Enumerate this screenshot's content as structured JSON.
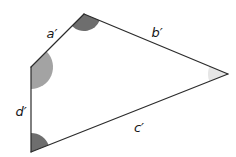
{
  "figure": {
    "type": "quadrilateral-diagram",
    "background_color": "#ffffff",
    "stroke_color": "#2b2b2b",
    "stroke_width": 1.2,
    "vertices": [
      {
        "name": "top",
        "x": 84,
        "y": 14
      },
      {
        "name": "right",
        "x": 228,
        "y": 74
      },
      {
        "name": "bottom-left",
        "x": 31,
        "y": 152
      },
      {
        "name": "left",
        "x": 31,
        "y": 67
      }
    ],
    "sides": [
      {
        "id": "a",
        "label": "a′",
        "from": "left",
        "to": "top",
        "label_x": 52,
        "label_y": 38
      },
      {
        "id": "b",
        "label": "b′",
        "from": "top",
        "to": "right",
        "label_x": 157,
        "label_y": 37
      },
      {
        "id": "c",
        "label": "c′",
        "from": "bottom-left",
        "to": "right",
        "label_x": 139,
        "label_y": 132
      },
      {
        "id": "d",
        "label": "d′",
        "from": "left",
        "to": "bottom-left",
        "label_x": 21,
        "label_y": 116
      }
    ],
    "angles": [
      {
        "at": "top",
        "shade": "#6e6e6e",
        "radius": 17
      },
      {
        "at": "right",
        "shade": "#e6e6e6",
        "radius": 20
      },
      {
        "at": "bottom-left",
        "shade": "#6e6e6e",
        "radius": 19
      },
      {
        "at": "left",
        "shade": "#a3a3a3",
        "radius": 22
      }
    ]
  }
}
